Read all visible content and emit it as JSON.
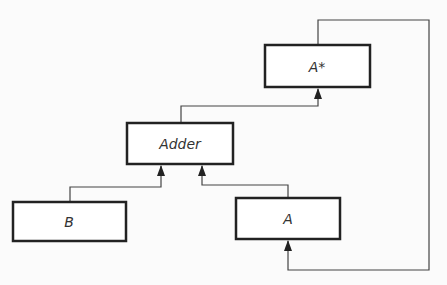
{
  "diagram": {
    "type": "block-diagram",
    "colors": {
      "line": "#3a3a3a",
      "box_fill": "#ffffff",
      "background": "#fbfbfb"
    },
    "nodes": [
      {
        "id": "a_star",
        "label": "A*",
        "x": 265,
        "y": 45,
        "w": 105,
        "h": 42
      },
      {
        "id": "adder",
        "label": "Adder",
        "x": 127,
        "y": 123,
        "w": 106,
        "h": 41
      },
      {
        "id": "b",
        "label": "B",
        "x": 13,
        "y": 202,
        "w": 113,
        "h": 39
      },
      {
        "id": "a",
        "label": "A",
        "x": 236,
        "y": 198,
        "w": 104,
        "h": 41
      }
    ],
    "edges": [
      {
        "from": "adder",
        "to": "a_star",
        "label": ""
      },
      {
        "from": "b",
        "to": "adder",
        "label": ""
      },
      {
        "from": "a",
        "to": "adder",
        "label": ""
      },
      {
        "from": "a_star",
        "to": "a",
        "label": "feedback"
      }
    ]
  },
  "labels": {
    "a_star": "A*",
    "adder": "Adder",
    "b": "B",
    "a": "A"
  }
}
